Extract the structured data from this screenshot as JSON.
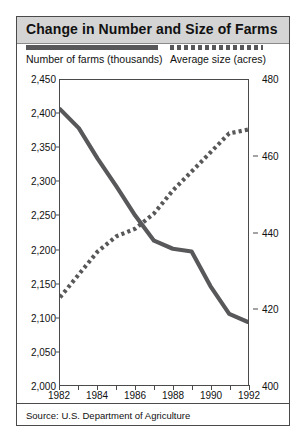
{
  "title": "Change in Number and Size of Farms",
  "source": "Source: U.S. Department of Agriculture",
  "legend": {
    "series1_label": "Number of farms (thousands)",
    "series2_label": "Average size (acres)"
  },
  "colors": {
    "line": "#58585a",
    "frame": "#4a4a4a",
    "title_band": "#d4d4d4",
    "text": "#111111",
    "background": "#ffffff"
  },
  "axes": {
    "left_ticks": [
      "2,450",
      "2,400",
      "2,350",
      "2,300",
      "2,250",
      "2,200",
      "2,150",
      "2,100",
      "2,050",
      "2,000"
    ],
    "right_ticks": [
      "480",
      "460",
      "440",
      "420",
      "400"
    ],
    "x_ticks": [
      "1982",
      "1984",
      "1986",
      "1988",
      "1990",
      "1992"
    ]
  },
  "chart_data": {
    "type": "line",
    "title": "Change in Number and Size of Farms",
    "xlabel": "",
    "ylabel": "Number of farms (thousands)",
    "y2label": "Average size (acres)",
    "x": [
      1982,
      1983,
      1984,
      1985,
      1986,
      1987,
      1988,
      1989,
      1990,
      1991,
      1992
    ],
    "xlim": [
      1982,
      1992
    ],
    "ylim": [
      2000,
      2450
    ],
    "y2lim": [
      400,
      480
    ],
    "grid": false,
    "legend_position": "top",
    "series": [
      {
        "name": "Number of farms (thousands)",
        "axis": "left",
        "style": "solid",
        "values": [
          2407,
          2379,
          2334,
          2293,
          2250,
          2213,
          2201,
          2197,
          2146,
          2105,
          2093
        ]
      },
      {
        "name": "Average size (acres)",
        "axis": "right",
        "style": "dotted",
        "values": [
          423,
          429,
          435,
          439,
          441,
          445,
          451,
          456,
          461,
          466,
          467
        ]
      }
    ]
  }
}
